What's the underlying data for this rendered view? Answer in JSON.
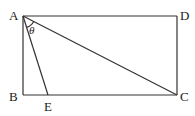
{
  "figure": {
    "points": [
      {
        "id": "A",
        "label": "A"
      },
      {
        "id": "B",
        "label": "B"
      },
      {
        "id": "C",
        "label": "C"
      },
      {
        "id": "D",
        "label": "D"
      },
      {
        "id": "E",
        "label": "E"
      }
    ],
    "angle_label": "θ",
    "segments": [
      "AD",
      "DC",
      "CB",
      "BA",
      "AE",
      "AC"
    ],
    "shape": "rectangle ABCD with segments AE and AC"
  }
}
